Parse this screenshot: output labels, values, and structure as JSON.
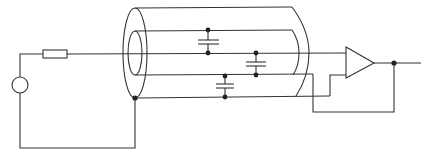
{
  "diagram": {
    "type": "circuit-schematic",
    "components": [
      {
        "id": "source",
        "kind": "voltage-source",
        "label": ""
      },
      {
        "id": "resistor",
        "kind": "resistor",
        "label": ""
      },
      {
        "id": "outer-shield",
        "kind": "coaxial-outer-shield",
        "label": ""
      },
      {
        "id": "inner-guard",
        "kind": "coaxial-inner-guard",
        "label": ""
      },
      {
        "id": "cap-signal-guard-top",
        "kind": "capacitor",
        "label": ""
      },
      {
        "id": "cap-signal-guard-mid",
        "kind": "capacitor",
        "label": ""
      },
      {
        "id": "cap-guard-shield",
        "kind": "capacitor",
        "label": ""
      },
      {
        "id": "amplifier",
        "kind": "op-amp-buffer",
        "label": ""
      }
    ],
    "colors": {
      "line": "#333333",
      "background": "#ffffff"
    }
  }
}
